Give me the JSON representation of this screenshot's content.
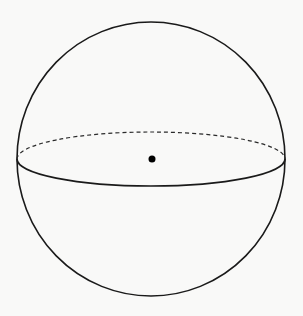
{
  "diagram": {
    "type": "sphere",
    "background": "#f9f9f8",
    "stroke_color": "#1a1a1a",
    "sphere": {
      "cx": 151,
      "cy": 159,
      "rx": 134,
      "ry": 137
    },
    "equator": {
      "cx": 151,
      "cy": 159,
      "rx": 134,
      "ry": 27,
      "back_half_style": "dashed",
      "front_half_style": "solid"
    },
    "center_point": {
      "cx": 152,
      "cy": 159,
      "r": 3.5
    }
  }
}
